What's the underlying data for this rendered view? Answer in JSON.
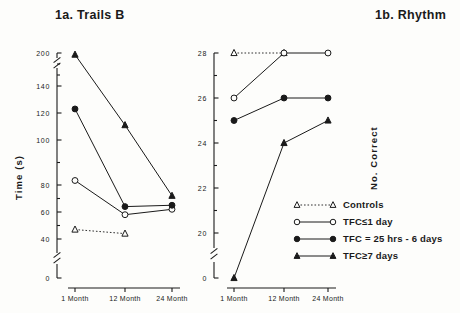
{
  "figure": {
    "panels": [
      {
        "title": "1a. Trails B",
        "ylabel": "Time (s)"
      },
      {
        "title": "1b. Rhythm",
        "ylabel": "No. Correct"
      }
    ]
  },
  "legend": {
    "entries": [
      {
        "label": "Controls",
        "marker": "open-triangle",
        "line": "dashed"
      },
      {
        "label": "TFC≤1 day",
        "marker": "open-circle",
        "line": "solid"
      },
      {
        "label": "TFC = 25 hrs - 6 days",
        "marker": "filled-circle",
        "line": "solid"
      },
      {
        "label": "TFC≥7 days",
        "marker": "filled-triangle",
        "line": "solid"
      }
    ]
  },
  "chart_data": [
    {
      "type": "line",
      "title": "1a. Trails B",
      "xlabel": "",
      "ylabel": "Time (s)",
      "categories": [
        "1 Month",
        "12 Month",
        "24 Month"
      ],
      "yticks": [
        0,
        40,
        60,
        80,
        100,
        120,
        140,
        200
      ],
      "ylim": [
        0,
        200
      ],
      "axis_breaks": [
        "140-200",
        "0-40"
      ],
      "grid": false,
      "legend_position": "none",
      "series": [
        {
          "name": "Controls",
          "marker": "open-triangle",
          "line": "dashed",
          "values": [
            47,
            44,
            null
          ]
        },
        {
          "name": "TFC≤1 day",
          "marker": "open-circle",
          "line": "solid",
          "values": [
            82,
            58,
            62
          ]
        },
        {
          "name": "TFC = 25 hrs - 6 days",
          "marker": "filled-circle",
          "line": "solid",
          "values": [
            123,
            64,
            65
          ]
        },
        {
          "name": "TFC≥7 days",
          "marker": "filled-triangle",
          "line": "solid",
          "values": [
            197,
            111,
            72
          ]
        }
      ]
    },
    {
      "type": "line",
      "title": "1b. Rhythm",
      "xlabel": "",
      "ylabel": "No. Correct",
      "categories": [
        "1 Month",
        "12 Month",
        "24 Month"
      ],
      "yticks": [
        0,
        20,
        22,
        24,
        26,
        28
      ],
      "ylim": [
        0,
        28
      ],
      "axis_breaks": [
        "0-20"
      ],
      "grid": false,
      "legend_position": "inside-bottom-right",
      "series": [
        {
          "name": "Controls",
          "marker": "open-triangle",
          "line": "dashed",
          "values": [
            28,
            28,
            null
          ]
        },
        {
          "name": "TFC≤1 day",
          "marker": "open-circle",
          "line": "solid",
          "values": [
            26,
            28,
            28
          ]
        },
        {
          "name": "TFC = 25 hrs - 6 days",
          "marker": "filled-circle",
          "line": "solid",
          "values": [
            25,
            26,
            26
          ]
        },
        {
          "name": "TFC≥7 days",
          "marker": "filled-triangle",
          "line": "solid",
          "values": [
            0,
            24,
            25
          ]
        }
      ]
    }
  ]
}
